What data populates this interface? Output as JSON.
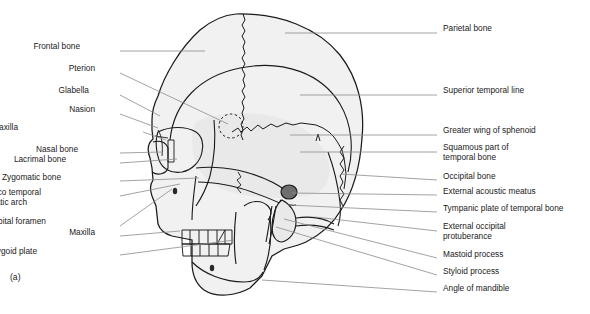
{
  "figure": {
    "marker": "(a)",
    "colors": {
      "bone_fill": "#f1f1f1",
      "bone_fill_dark": "#e4e4e4",
      "outline": "#1a1a1a",
      "leader_line": "#8c8c8c",
      "meatus_fill": "#6e6e6e",
      "text": "#1a1a1a",
      "background": "#ffffff"
    }
  },
  "labels_left": [
    {
      "text": "Frontal bone",
      "x": 80,
      "y": 47,
      "tx": 120,
      "ty": 51,
      "px": 205,
      "py": 51
    },
    {
      "text": "Pterion",
      "x": 95,
      "y": 69,
      "tx": 120,
      "ty": 73,
      "px": 228,
      "py": 124
    },
    {
      "text": "Glabella",
      "x": 89,
      "y": 91,
      "tx": 120,
      "ty": 95,
      "px": 160,
      "py": 116
    },
    {
      "text": "Nasion",
      "x": 95,
      "y": 110,
      "tx": 120,
      "ty": 114,
      "px": 158,
      "py": 128
    },
    {
      "text": "Frontal process of maxilla",
      "x": 18,
      "y": 128,
      "tx": 143,
      "ty": 132,
      "px": 166,
      "py": 140
    },
    {
      "text": "Nasal bone",
      "x": 78,
      "y": 150,
      "tx": 120,
      "ty": 153,
      "px": 162,
      "py": 152
    },
    {
      "text": "Lacrimal bone",
      "x": 66,
      "y": 160,
      "tx": 120,
      "ty": 163,
      "px": 177,
      "py": 159
    },
    {
      "text": "Zygomatic bone",
      "x": 61,
      "y": 178,
      "tx": 120,
      "ty": 181,
      "px": 199,
      "py": 178
    },
    {
      "text": "Zygomatico temporal",
      "x": 41,
      "y": 193,
      "tx": 120,
      "ty": 196,
      "px": 180,
      "py": 184
    },
    {
      "text": "suture of zygomatic arch",
      "x": 27,
      "y": 203,
      "tx": 120,
      "ty": 196,
      "px": 180,
      "py": 184
    },
    {
      "text": "Infraorbital foramen",
      "x": 46,
      "y": 222,
      "tx": 120,
      "ty": 226,
      "px": 172,
      "py": 189
    },
    {
      "text": "Maxilla",
      "x": 95,
      "y": 233,
      "tx": 120,
      "ty": 236,
      "px": 180,
      "py": 231
    },
    {
      "text": "Lateral pterygoid plate",
      "x": 37,
      "y": 252,
      "tx": 120,
      "ty": 255,
      "px": 234,
      "py": 240
    }
  ],
  "labels_right": [
    {
      "text": "Parietal bone",
      "x": 443,
      "y": 29,
      "tx": 437,
      "ty": 33,
      "px": 285,
      "py": 33
    },
    {
      "text": "Superior temporal line",
      "x": 443,
      "y": 91,
      "tx": 437,
      "ty": 95,
      "px": 300,
      "py": 95
    },
    {
      "text": "Greater wing of sphenoid",
      "x": 443,
      "y": 131,
      "tx": 437,
      "ty": 135,
      "px": 290,
      "py": 135
    },
    {
      "text": "Squamous part of",
      "x": 443,
      "y": 148,
      "tx": 437,
      "ty": 152,
      "px": 300,
      "py": 152
    },
    {
      "text": "temporal bone",
      "x": 443,
      "y": 158,
      "tx": 437,
      "ty": 152,
      "px": 300,
      "py": 152
    },
    {
      "text": "Occipital bone",
      "x": 443,
      "y": 177,
      "tx": 437,
      "ty": 180,
      "px": 341,
      "py": 174
    },
    {
      "text": "External acoustic meatus",
      "x": 443,
      "y": 192,
      "tx": 437,
      "ty": 195,
      "px": 292,
      "py": 193
    },
    {
      "text": "Tympanic plate of temporal bone",
      "x": 443,
      "y": 209,
      "tx": 437,
      "ty": 212,
      "px": 288,
      "py": 205
    },
    {
      "text": "External occipital",
      "x": 443,
      "y": 227,
      "tx": 437,
      "ty": 231,
      "px": 315,
      "py": 217
    },
    {
      "text": "protuberance",
      "x": 443,
      "y": 237,
      "tx": 437,
      "ty": 231,
      "px": 315,
      "py": 217
    },
    {
      "text": "Mastoid process",
      "x": 443,
      "y": 255,
      "tx": 437,
      "ty": 258,
      "px": 284,
      "py": 219
    },
    {
      "text": "Styloid process",
      "x": 443,
      "y": 272,
      "tx": 437,
      "ty": 275,
      "px": 276,
      "py": 227
    },
    {
      "text": "Angle of mandible",
      "x": 443,
      "y": 289,
      "tx": 437,
      "ty": 292,
      "px": 262,
      "py": 280
    }
  ],
  "anatomy_parts": [
    "cranial-vault",
    "frontal-bone",
    "parietal-bone",
    "occipital-bone",
    "temporal-squamous",
    "greater-wing-sphenoid",
    "superior-temporal-line",
    "coronal-suture",
    "pterion-circle",
    "nasal-aperture",
    "orbit",
    "zygomatic-arch",
    "maxilla",
    "mandible",
    "teeth-upper",
    "teeth-lower",
    "external-acoustic-meatus",
    "mastoid-process",
    "styloid-process",
    "infraorbital-foramen",
    "mental-foramen"
  ]
}
